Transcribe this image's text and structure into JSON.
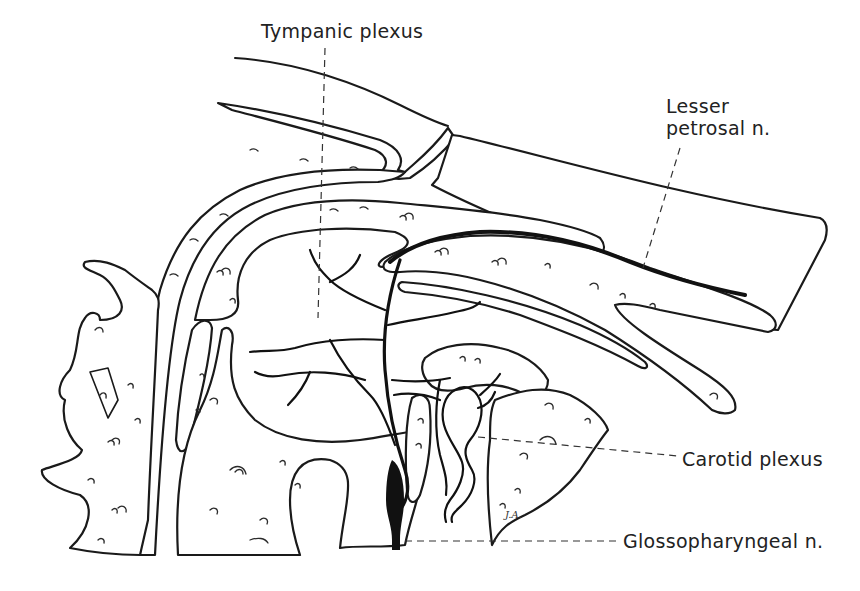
{
  "figure": {
    "type": "anatomical line drawing",
    "style": "black ink on white",
    "colors": {
      "ink": "#1a1a1a",
      "background": "#ffffff",
      "label_text": "#222222"
    }
  },
  "labels": {
    "tympanic_plexus": "Tympanic plexus",
    "lesser_petrosal_line1": "Lesser",
    "lesser_petrosal_line2": "petrosal n.",
    "carotid_plexus": "Carotid plexus",
    "glossopharyngeal": "Glossopharyngeal n."
  },
  "signature": "J.A."
}
